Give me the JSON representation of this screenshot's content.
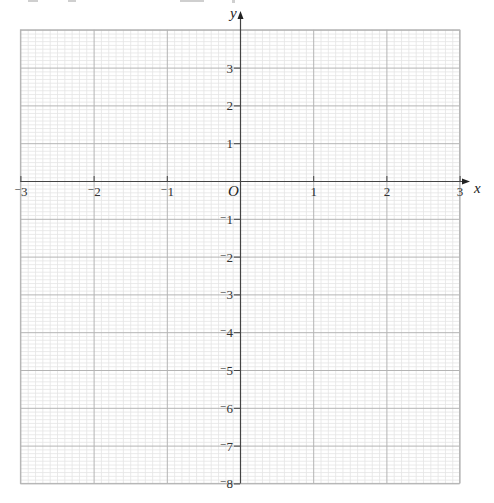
{
  "chart_data": {
    "type": "line",
    "title": "",
    "xlabel": "x",
    "ylabel": "y",
    "origin_label": "O",
    "xlim": [
      -3,
      3
    ],
    "ylim": [
      -8,
      4
    ],
    "x_ticks": [
      -3,
      -2,
      -1,
      1,
      2,
      3
    ],
    "y_ticks": [
      3,
      2,
      1,
      -1,
      -2,
      -3,
      -4,
      -5,
      -6,
      -7,
      -8
    ],
    "x_tick_labels": [
      "⁻3",
      "⁻2",
      "⁻1",
      "1",
      "2",
      "3"
    ],
    "y_tick_labels": [
      "3",
      "2",
      "1",
      "⁻1",
      "⁻2",
      "⁻3",
      "⁻4",
      "⁻5",
      "⁻6",
      "⁻7",
      "⁻8"
    ],
    "grid": true,
    "grid_major_step": 1,
    "grid_minor_subdivisions": 10,
    "series": [],
    "legend": null
  },
  "colors": {
    "axis": "#444444",
    "grid_major": "#b4b4b4",
    "grid_minor": "#e4e4e4",
    "text": "#333333"
  },
  "layout": {
    "grid_left": 19,
    "grid_right": 459,
    "grid_top": 29,
    "grid_bottom": 483,
    "origin_x": 240,
    "origin_y": 181,
    "px_per_unit_x": 73.2,
    "px_per_unit_y": 37.8
  }
}
